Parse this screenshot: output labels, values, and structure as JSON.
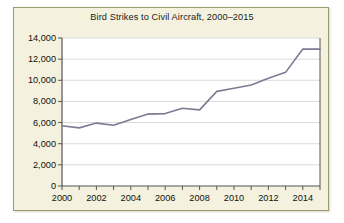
{
  "chart_data": {
    "type": "line",
    "title": "Bird Strikes to Civil Aircraft, 2000–2015",
    "xlabel": "",
    "ylabel": "",
    "x": [
      2000,
      2001,
      2002,
      2003,
      2004,
      2005,
      2006,
      2007,
      2008,
      2009,
      2010,
      2011,
      2012,
      2013,
      2014,
      2015
    ],
    "values": [
      5700,
      5500,
      5950,
      5750,
      6300,
      6800,
      6850,
      7350,
      7200,
      8950,
      9250,
      9550,
      10200,
      10750,
      12950,
      12950
    ],
    "series": [
      {
        "name": "Bird strikes",
        "values": [
          5700,
          5500,
          5950,
          5750,
          6300,
          6800,
          6850,
          7350,
          7200,
          8950,
          9250,
          9550,
          10200,
          10750,
          12950,
          12950
        ]
      }
    ],
    "xlim": [
      2000,
      2015
    ],
    "ylim": [
      0,
      14000
    ],
    "ytick_values": [
      0,
      2000,
      4000,
      6000,
      8000,
      10000,
      12000,
      14000
    ],
    "ytick_labels": [
      "0",
      "2,000",
      "4,000",
      "6,000",
      "8,000",
      "10,000",
      "12,000",
      "14,000"
    ],
    "xtick_values": [
      2000,
      2001,
      2002,
      2003,
      2004,
      2005,
      2006,
      2007,
      2008,
      2009,
      2010,
      2011,
      2012,
      2013,
      2014,
      2015
    ],
    "xtick_labels": [
      "2000",
      "",
      "2002",
      "",
      "2004",
      "",
      "2006",
      "",
      "2008",
      "",
      "2010",
      "",
      "2012",
      "",
      "2014",
      ""
    ],
    "grid": "horizontal",
    "legend": "none",
    "line_color": "#7b7b93",
    "grid_color": "#d0d0d0",
    "axis_color": "#555555",
    "plot_background": "#ffffff",
    "figure_background": "#f4f2de"
  }
}
